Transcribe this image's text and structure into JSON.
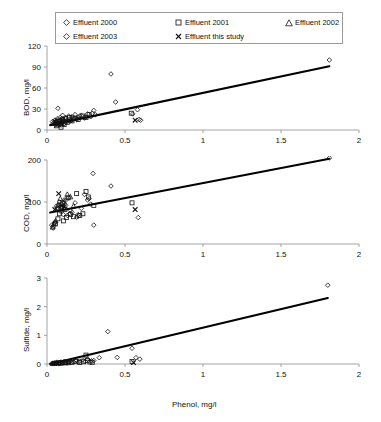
{
  "figure": {
    "xlabel": "Phenol, mg/l",
    "legend": {
      "position": "top",
      "entries": [
        {
          "label": "Effluent 2000",
          "marker": "diamond-open",
          "marker_icon": "diamond-icon"
        },
        {
          "label": "Effluent 2001",
          "marker": "square-open",
          "marker_icon": "square-icon"
        },
        {
          "label": "Effluent 2002",
          "marker": "triangle-open",
          "marker_icon": "triangle-icon"
        },
        {
          "label": "Effluent 2003",
          "marker": "diamond-open",
          "marker_icon": "diamond-icon"
        },
        {
          "label": "Effluent this study",
          "marker": "cross-x",
          "marker_icon": "x-cross-icon"
        }
      ]
    }
  },
  "chart_data": [
    {
      "type": "scatter",
      "title": "",
      "xlabel": "Phenol, mg/l",
      "ylabel": "BOD, mg/l",
      "xlim": [
        0,
        2
      ],
      "ylim": [
        0,
        120
      ],
      "xticks": [
        0,
        0.5,
        1,
        1.5,
        2
      ],
      "xticklabels": [
        "0",
        "0.5",
        "1",
        "1.5",
        "2"
      ],
      "yticks": [
        0,
        30,
        60,
        90,
        120
      ],
      "yticklabels": [
        "0",
        "30",
        "60",
        "90",
        "120"
      ],
      "grid": false,
      "trendline": {
        "x": [
          0.02,
          1.81
        ],
        "y": [
          7,
          91
        ]
      },
      "series": [
        {
          "name": "Effluent 2000",
          "marker": "diamond-open",
          "points": [
            [
              0.035,
              12
            ],
            [
              0.04,
              9
            ],
            [
              0.05,
              14
            ],
            [
              0.055,
              8
            ],
            [
              0.06,
              11
            ],
            [
              0.065,
              16
            ],
            [
              0.07,
              31
            ],
            [
              0.075,
              13
            ],
            [
              0.08,
              10
            ],
            [
              0.085,
              18
            ],
            [
              0.09,
              7
            ],
            [
              0.095,
              12
            ],
            [
              0.1,
              21
            ],
            [
              0.105,
              15
            ],
            [
              0.11,
              9
            ],
            [
              0.12,
              17
            ],
            [
              0.13,
              14
            ],
            [
              0.14,
              20
            ],
            [
              0.15,
              13
            ],
            [
              0.16,
              19
            ],
            [
              0.17,
              16
            ],
            [
              0.18,
              22
            ],
            [
              0.19,
              15
            ],
            [
              0.2,
              18
            ],
            [
              0.22,
              21
            ],
            [
              0.24,
              17
            ],
            [
              0.26,
              23
            ],
            [
              0.28,
              19
            ],
            [
              0.3,
              28
            ],
            [
              0.31,
              22
            ],
            [
              0.41,
              80
            ],
            [
              0.44,
              40
            ],
            [
              0.55,
              23
            ],
            [
              0.58,
              29
            ],
            [
              0.59,
              15
            ],
            [
              0.6,
              14
            ],
            [
              1.81,
              100
            ]
          ]
        },
        {
          "name": "Effluent 2001",
          "marker": "square-open",
          "points": [
            [
              0.06,
              6
            ],
            [
              0.07,
              9
            ],
            [
              0.08,
              12
            ],
            [
              0.09,
              4
            ],
            [
              0.095,
              10
            ],
            [
              0.1,
              14
            ],
            [
              0.11,
              8
            ],
            [
              0.12,
              16
            ],
            [
              0.13,
              11
            ],
            [
              0.145,
              18
            ],
            [
              0.16,
              13
            ],
            [
              0.18,
              17
            ],
            [
              0.2,
              15
            ],
            [
              0.23,
              20
            ],
            [
              0.25,
              18
            ],
            [
              0.27,
              22
            ],
            [
              0.54,
              24
            ]
          ]
        },
        {
          "name": "Effluent 2002",
          "marker": "triangle-open",
          "points": [
            [
              0.05,
              10
            ],
            [
              0.06,
              13
            ],
            [
              0.07,
              8
            ],
            [
              0.085,
              15
            ],
            [
              0.1,
              12
            ],
            [
              0.12,
              17
            ],
            [
              0.15,
              14
            ]
          ]
        },
        {
          "name": "Effluent 2003",
          "marker": "diamond-open",
          "points": [
            [
              0.045,
              11
            ],
            [
              0.055,
              9
            ],
            [
              0.065,
              13
            ],
            [
              0.08,
              7
            ],
            [
              0.1,
              16
            ],
            [
              0.13,
              12
            ],
            [
              0.17,
              18
            ],
            [
              0.21,
              20
            ],
            [
              0.29,
              24
            ]
          ]
        },
        {
          "name": "Effluent this study",
          "marker": "cross-x",
          "points": [
            [
              0.055,
              12
            ],
            [
              0.09,
              10
            ],
            [
              0.565,
              14
            ]
          ]
        }
      ]
    },
    {
      "type": "scatter",
      "title": "",
      "xlabel": "Phenol, mg/l",
      "ylabel": "COD, mg/l",
      "xlim": [
        0,
        2
      ],
      "ylim": [
        0,
        200
      ],
      "xticks": [
        0,
        0.5,
        1,
        1.5,
        2
      ],
      "xticklabels": [
        "0",
        "0.5",
        "1",
        "1.5",
        "2"
      ],
      "yticks": [
        0,
        100,
        200
      ],
      "yticklabels": [
        "0",
        "100",
        "200"
      ],
      "grid": false,
      "trendline": {
        "x": [
          0.02,
          1.81
        ],
        "y": [
          75,
          203
        ]
      },
      "series": [
        {
          "name": "Effluent 2000",
          "marker": "diamond-open",
          "points": [
            [
              0.03,
              45
            ],
            [
              0.04,
              38
            ],
            [
              0.05,
              52
            ],
            [
              0.06,
              90
            ],
            [
              0.07,
              85
            ],
            [
              0.08,
              100
            ],
            [
              0.085,
              78
            ],
            [
              0.09,
              95
            ],
            [
              0.1,
              88
            ],
            [
              0.105,
              70
            ],
            [
              0.11,
              105
            ],
            [
              0.12,
              92
            ],
            [
              0.13,
              68
            ],
            [
              0.14,
              110
            ],
            [
              0.15,
              80
            ],
            [
              0.16,
              75
            ],
            [
              0.18,
              98
            ],
            [
              0.19,
              64
            ],
            [
              0.2,
              70
            ],
            [
              0.22,
              85
            ],
            [
              0.24,
              118
            ],
            [
              0.26,
              105
            ],
            [
              0.28,
              95
            ],
            [
              0.295,
              168
            ],
            [
              0.3,
              45
            ],
            [
              0.41,
              138
            ],
            [
              0.585,
              63
            ],
            [
              1.81,
              205
            ]
          ]
        },
        {
          "name": "Effluent 2001",
          "marker": "square-open",
          "points": [
            [
              0.055,
              48
            ],
            [
              0.07,
              60
            ],
            [
              0.08,
              72
            ],
            [
              0.09,
              88
            ],
            [
              0.1,
              96
            ],
            [
              0.105,
              55
            ],
            [
              0.115,
              82
            ],
            [
              0.125,
              63
            ],
            [
              0.135,
              110
            ],
            [
              0.15,
              70
            ],
            [
              0.17,
              65
            ],
            [
              0.19,
              120
            ],
            [
              0.21,
              68
            ],
            [
              0.23,
              72
            ],
            [
              0.25,
              125
            ],
            [
              0.265,
              112
            ],
            [
              0.3,
              92
            ],
            [
              0.545,
              98
            ]
          ]
        },
        {
          "name": "Effluent 2002",
          "marker": "triangle-open",
          "points": [
            [
              0.035,
              40
            ],
            [
              0.045,
              48
            ],
            [
              0.055,
              55
            ],
            [
              0.07,
              92
            ],
            [
              0.085,
              108
            ],
            [
              0.095,
              85
            ],
            [
              0.11,
              100
            ],
            [
              0.13,
              118
            ],
            [
              0.15,
              112
            ],
            [
              0.17,
              90
            ]
          ]
        },
        {
          "name": "Effluent 2003",
          "marker": "diamond-open",
          "points": [
            [
              0.04,
              42
            ],
            [
              0.05,
              50
            ],
            [
              0.065,
              86
            ],
            [
              0.075,
              94
            ],
            [
              0.095,
              78
            ],
            [
              0.12,
              104
            ],
            [
              0.145,
              72
            ],
            [
              0.2,
              66
            ],
            [
              0.27,
              108
            ]
          ]
        },
        {
          "name": "Effluent this study",
          "marker": "cross-x",
          "points": [
            [
              0.05,
              82
            ],
            [
              0.075,
              120
            ],
            [
              0.095,
              92
            ],
            [
              0.11,
              88
            ],
            [
              0.565,
              82
            ]
          ]
        }
      ]
    },
    {
      "type": "scatter",
      "title": "",
      "xlabel": "Phenol, mg/l",
      "ylabel": "Sulfide, mg/l",
      "xlim": [
        0,
        2
      ],
      "ylim": [
        0,
        3
      ],
      "xticks": [
        0,
        0.5,
        1,
        1.5,
        2
      ],
      "xticklabels": [
        "0",
        "0.5",
        "1",
        "1.5",
        "2"
      ],
      "yticks": [
        0,
        1,
        2,
        3
      ],
      "yticklabels": [
        "0",
        "1",
        "2",
        "3"
      ],
      "grid": false,
      "trendline": {
        "x": [
          0.02,
          1.8
        ],
        "y": [
          0.0,
          2.3
        ]
      },
      "series": [
        {
          "name": "Effluent 2000",
          "marker": "diamond-open",
          "points": [
            [
              0.03,
              0.02
            ],
            [
              0.04,
              0.03
            ],
            [
              0.05,
              0.04
            ],
            [
              0.06,
              0.05
            ],
            [
              0.07,
              0.06
            ],
            [
              0.08,
              0.04
            ],
            [
              0.09,
              0.07
            ],
            [
              0.1,
              0.05
            ],
            [
              0.11,
              0.09
            ],
            [
              0.12,
              0.06
            ],
            [
              0.13,
              0.08
            ],
            [
              0.14,
              0.07
            ],
            [
              0.15,
              0.1
            ],
            [
              0.17,
              0.08
            ],
            [
              0.19,
              0.12
            ],
            [
              0.21,
              0.1
            ],
            [
              0.23,
              0.14
            ],
            [
              0.26,
              0.17
            ],
            [
              0.3,
              0.12
            ],
            [
              0.335,
              0.22
            ],
            [
              0.39,
              1.13
            ],
            [
              0.45,
              0.23
            ],
            [
              0.545,
              0.55
            ],
            [
              0.57,
              0.22
            ],
            [
              0.595,
              0.17
            ],
            [
              1.8,
              2.75
            ]
          ]
        },
        {
          "name": "Effluent 2001",
          "marker": "square-open",
          "points": [
            [
              0.085,
              0.03
            ],
            [
              0.1,
              0.05
            ],
            [
              0.12,
              0.04
            ],
            [
              0.14,
              0.07
            ],
            [
              0.16,
              0.06
            ],
            [
              0.185,
              0.09
            ],
            [
              0.21,
              0.05
            ],
            [
              0.235,
              0.08
            ],
            [
              0.25,
              0.31
            ],
            [
              0.26,
              0.12
            ],
            [
              0.275,
              0.07
            ],
            [
              0.29,
              0.06
            ],
            [
              0.545,
              0.09
            ]
          ]
        },
        {
          "name": "Effluent 2002",
          "marker": "triangle-open",
          "points": [
            [
              0.035,
              0.01
            ],
            [
              0.05,
              0.02
            ],
            [
              0.065,
              0.03
            ],
            [
              0.08,
              0.04
            ],
            [
              0.095,
              0.03
            ],
            [
              0.115,
              0.05
            ],
            [
              0.135,
              0.04
            ]
          ]
        },
        {
          "name": "Effluent 2003",
          "marker": "diamond-open",
          "points": [
            [
              0.045,
              0.02
            ],
            [
              0.06,
              0.03
            ],
            [
              0.075,
              0.02
            ],
            [
              0.11,
              0.06
            ],
            [
              0.155,
              0.05
            ],
            [
              0.2,
              0.07
            ],
            [
              0.245,
              0.09
            ],
            [
              0.285,
              0.11
            ]
          ]
        },
        {
          "name": "Effluent this study",
          "marker": "cross-x",
          "points": [
            [
              0.05,
              0.02
            ],
            [
              0.07,
              0.03
            ],
            [
              0.555,
              0.05
            ]
          ]
        }
      ]
    }
  ]
}
